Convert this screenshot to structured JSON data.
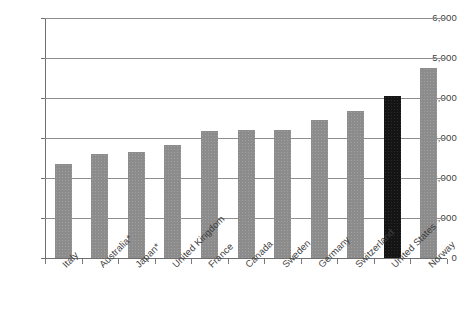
{
  "chart_data": {
    "type": "bar",
    "title": "",
    "subtitle": "",
    "xlabel": "",
    "ylabel": "",
    "categories": [
      "Italy",
      "Australia*",
      "Japan*",
      "United Kingdom",
      "France",
      "Canada",
      "Sweden",
      "Germany",
      "Switzerland",
      "United States",
      "Norway"
    ],
    "values": [
      2350,
      2600,
      2650,
      2830,
      3180,
      3200,
      3200,
      3450,
      3670,
      4050,
      4750
    ],
    "highlight_category": "United States",
    "highlight_color": "#141414",
    "bar_color": "#8c8c8c",
    "ylim": [
      0,
      6000
    ],
    "ytick_labels": [
      "6,000",
      "5,000",
      "4,000",
      "3,000",
      "2,000",
      "1,000",
      "0"
    ],
    "ytick_values": [
      6000,
      5000,
      4000,
      3000,
      2000,
      1000,
      0
    ],
    "grid": true,
    "legend": "none",
    "gridline_color": "#8f8f8f",
    "axis_color": "#6f6f6f"
  }
}
